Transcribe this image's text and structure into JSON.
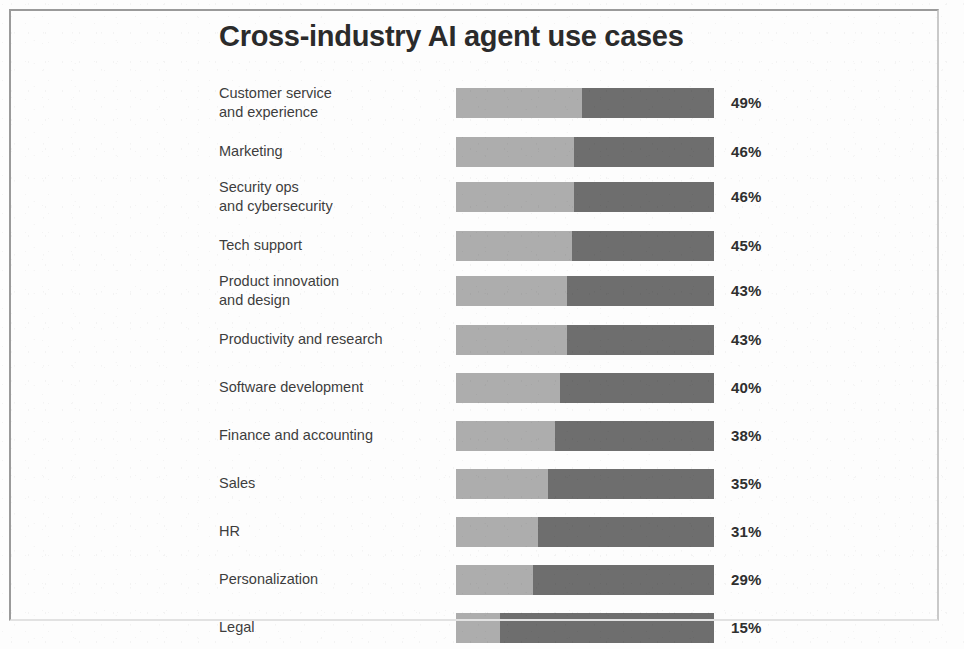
{
  "chart": {
    "title": "Cross-industry AI agent use cases"
  },
  "chart_data": {
    "type": "bar",
    "title": "Cross-industry AI agent use cases",
    "xlabel": "",
    "ylabel": "",
    "orientation": "horizontal",
    "grid": false,
    "legend": "none",
    "axis_visible": false,
    "value_suffix": "%",
    "xlim": [
      0,
      100
    ],
    "track_style": "full-width bar with light-gray value segment on the left and dark-gray remainder on the right",
    "colors": {
      "value_segment": "#adadad",
      "remainder_segment": "#6e6e6e",
      "title": "#2b2b2b",
      "label": "#3d3d3d",
      "value_text": "#2f2f2f",
      "background": "#fdfdfd",
      "page_border": "#9a9a9a"
    },
    "categories": [
      "Customer service and experience",
      "Marketing",
      "Security ops and cybersecurity",
      "Tech support",
      "Product innovation and design",
      "Productivity and research",
      "Software development",
      "Finance and accounting",
      "Sales",
      "HR",
      "Personalization",
      "Legal"
    ],
    "values": [
      49,
      46,
      46,
      45,
      43,
      43,
      40,
      38,
      35,
      31,
      29,
      15
    ]
  },
  "rows": [
    {
      "label_line1": "Customer service",
      "label_line2": "and experience",
      "value": 49,
      "value_label": "49%",
      "top": 0,
      "label_top": 2,
      "bar_top": 6,
      "value_top": 12
    },
    {
      "label_line1": "Marketing",
      "label_line2": "",
      "value": 46,
      "value_label": "46%",
      "top": 48,
      "label_top": 12,
      "bar_top": 7,
      "value_top": 13
    },
    {
      "label_line1": "Security ops",
      "label_line2": "and cybersecurity",
      "value": 46,
      "value_label": "46%",
      "top": 94,
      "label_top": 2,
      "bar_top": 6,
      "value_top": 12
    },
    {
      "label_line1": "Tech support",
      "label_line2": "",
      "value": 45,
      "value_label": "45%",
      "top": 142,
      "label_top": 12,
      "bar_top": 7,
      "value_top": 13
    },
    {
      "label_line1": "Product innovation",
      "label_line2": "and design",
      "value": 43,
      "value_label": "43%",
      "top": 188,
      "label_top": 2,
      "bar_top": 6,
      "value_top": 12
    },
    {
      "label_line1": "Productivity and research",
      "label_line2": "",
      "value": 43,
      "value_label": "43%",
      "top": 236,
      "label_top": 12,
      "bar_top": 7,
      "value_top": 13
    },
    {
      "label_line1": "Software development",
      "label_line2": "",
      "value": 40,
      "value_label": "40%",
      "top": 284,
      "label_top": 12,
      "bar_top": 7,
      "value_top": 13
    },
    {
      "label_line1": "Finance and accounting",
      "label_line2": "",
      "value": 38,
      "value_label": "38%",
      "top": 332,
      "label_top": 12,
      "bar_top": 7,
      "value_top": 13
    },
    {
      "label_line1": "Sales",
      "label_line2": "",
      "value": 35,
      "value_label": "35%",
      "top": 380,
      "label_top": 12,
      "bar_top": 7,
      "value_top": 13
    },
    {
      "label_line1": "HR",
      "label_line2": "",
      "value": 31,
      "value_label": "31%",
      "top": 428,
      "label_top": 12,
      "bar_top": 7,
      "value_top": 13
    },
    {
      "label_line1": "Personalization",
      "label_line2": "",
      "value": 29,
      "value_label": "29%",
      "top": 476,
      "label_top": 12,
      "bar_top": 7,
      "value_top": 13
    },
    {
      "label_line1": "Legal",
      "label_line2": "",
      "value": 15,
      "value_label": "15%",
      "top": 524,
      "label_top": 12,
      "bar_top": 7,
      "value_top": 13
    }
  ]
}
